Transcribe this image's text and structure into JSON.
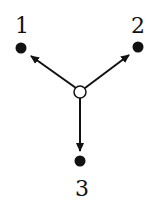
{
  "diagram": {
    "type": "directed-graph",
    "center_node": {
      "id": "center",
      "style": "hollow",
      "x": 80,
      "y": 92
    },
    "nodes": [
      {
        "id": "1",
        "label": "1",
        "x": 21,
        "y": 48,
        "label_x": 22,
        "label_y": 33
      },
      {
        "id": "2",
        "label": "2",
        "x": 138,
        "y": 47,
        "label_x": 138,
        "label_y": 33
      },
      {
        "id": "3",
        "label": "3",
        "x": 80,
        "y": 161,
        "label_x": 82,
        "label_y": 196
      }
    ],
    "edges": [
      {
        "from": "center",
        "to": "1",
        "directed": true
      },
      {
        "from": "center",
        "to": "2",
        "directed": true
      },
      {
        "from": "center",
        "to": "3",
        "directed": true
      }
    ],
    "colors": {
      "node_fill": "#111111",
      "edge": "#111111",
      "center_fill": "#ffffff"
    }
  }
}
